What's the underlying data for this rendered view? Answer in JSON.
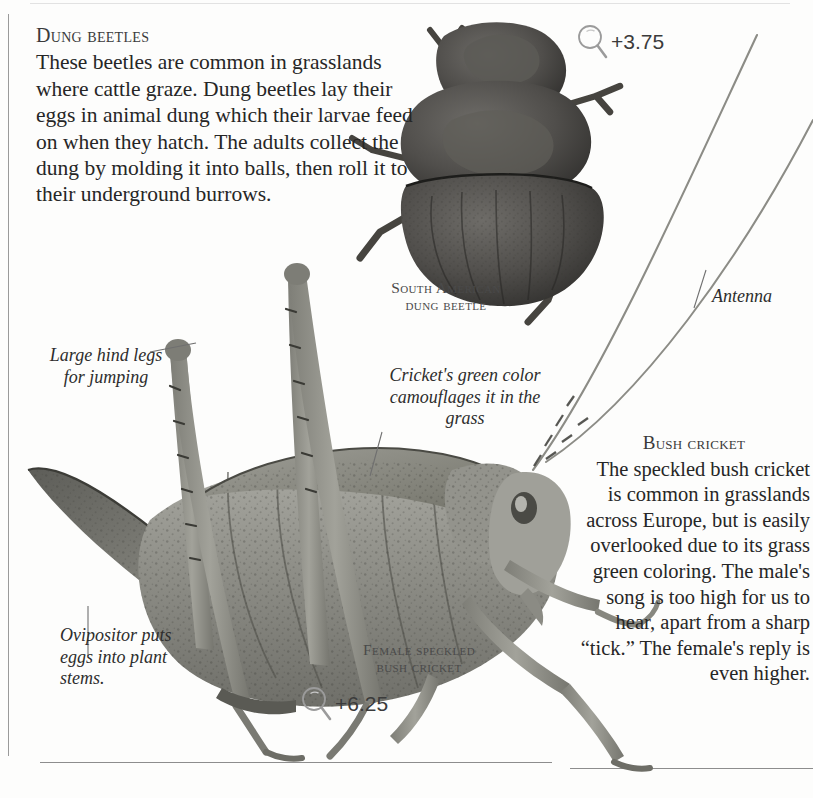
{
  "page": {
    "background": "#fdfdfc",
    "ink": "#262626"
  },
  "beetle_section": {
    "heading": "Dung beetles",
    "body": "These beetles are common in grasslands where cattle graze. Dung beetles lay their eggs in animal dung which their larvae feed on when they hatch. The adults collect the dung by molding it into balls, then roll it to their underground burrows.",
    "caption": "South American dung beetle",
    "magnification": "+3.75",
    "magnifier_icon": "magnifier-icon"
  },
  "cricket_section": {
    "heading": "Bush cricket",
    "body": "The speckled bush cricket is common in grasslands across Europe, but is easily overlooked due to its grass green coloring. The male's song is too high for us to hear, apart from a sharp “tick.” The female's reply is even higher.",
    "caption": "Female speckled bush cricket",
    "magnification": "+6.25",
    "magnifier_icon": "magnifier-icon"
  },
  "annotations": [
    {
      "id": "hind-legs",
      "text": "Large hind legs for jumping"
    },
    {
      "id": "ovipositor",
      "text": "Ovipositor puts eggs into plant stems."
    },
    {
      "id": "camouflage",
      "text": "Cricket's green color camouflages it in the grass"
    },
    {
      "id": "antenna",
      "text": "Antenna"
    }
  ],
  "specimens": [
    {
      "name": "south-american-dung-beetle",
      "tone": "#4b4a48"
    },
    {
      "name": "female-speckled-bush-cricket",
      "tone": "#8d8d88"
    }
  ]
}
